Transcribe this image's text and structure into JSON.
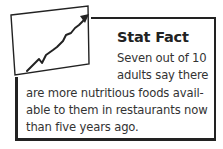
{
  "callout": {
    "title": "Stat Fact",
    "icon": "trending-up-chart-icon",
    "lines": [
      "Seven out of 10",
      "adults say there",
      "are more nutritious foods avail-",
      "able to them in restaurants now",
      "than five years ago."
    ]
  }
}
